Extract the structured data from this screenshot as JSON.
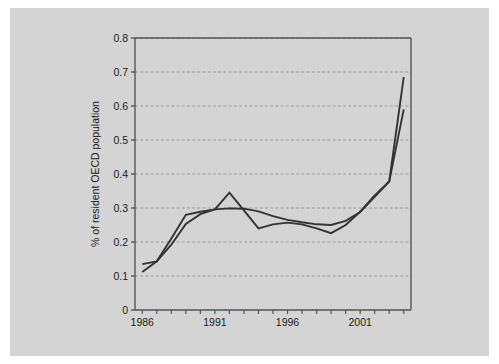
{
  "figure": {
    "background_color": "#d4d4d4",
    "plot_background_color": "#ffffff",
    "frame_color": "#555555",
    "gridline_color": "#9a9a9a",
    "series_color": "#333333"
  },
  "chart_data": {
    "type": "line",
    "title": "",
    "subtitle": "",
    "xlabel": "",
    "ylabel": "% of resident OECD population",
    "xlim": [
      1985.5,
      2004.5
    ],
    "ylim": [
      0,
      0.8
    ],
    "grid": true,
    "grid_axis": "y",
    "legend": false,
    "legend_position": "none",
    "y_ticks": [
      0,
      0.1,
      0.2,
      0.3,
      0.4,
      0.5,
      0.6,
      0.7,
      0.8
    ],
    "y_tick_labels": [
      "0",
      "0.1",
      "0.2",
      "0.3",
      "0.4",
      "0.5",
      "0.6",
      "0.7",
      "0.8"
    ],
    "x_ticks": [
      1986,
      1987,
      1988,
      1989,
      1990,
      1991,
      1992,
      1993,
      1994,
      1995,
      1996,
      1997,
      1998,
      1999,
      2000,
      2001,
      2002,
      2003,
      2004
    ],
    "x_tick_labels": [
      "1986",
      "",
      "",
      "",
      "",
      "1991",
      "",
      "",
      "",
      "",
      "1996",
      "",
      "",
      "",
      "",
      "2001",
      "",
      "",
      ""
    ],
    "x": [
      1986,
      1987,
      1988,
      1989,
      1990,
      1991,
      1992,
      1993,
      1994,
      1995,
      1996,
      1997,
      1998,
      1999,
      2000,
      2001,
      2002,
      2003,
      2004
    ],
    "series": [
      {
        "name": "series-1",
        "values": [
          0.112,
          0.143,
          0.192,
          0.253,
          0.282,
          0.296,
          0.345,
          0.293,
          0.24,
          0.252,
          0.257,
          0.252,
          0.24,
          0.226,
          0.25,
          0.289,
          0.337,
          0.378,
          0.59
        ]
      },
      {
        "name": "series-2",
        "values": [
          0.135,
          0.143,
          0.21,
          0.28,
          0.289,
          0.296,
          0.299,
          0.298,
          0.29,
          0.276,
          0.265,
          0.258,
          0.252,
          0.25,
          0.262,
          0.288,
          0.333,
          0.378,
          0.685
        ]
      }
    ],
    "annotations": []
  }
}
